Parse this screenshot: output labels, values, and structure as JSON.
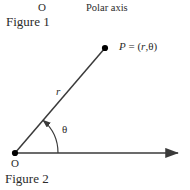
{
  "figure": {
    "caption_top": "Figure 1",
    "caption_bottom": "Figure 2",
    "top_origin_label": "O",
    "polar_axis_label": "Polar axis"
  },
  "diagram": {
    "type": "polar-coordinate-diagram",
    "point_label_p": "P",
    "point_label_equals": " = (",
    "point_label_r": "r",
    "point_label_comma": ",",
    "point_label_theta": "θ",
    "point_label_close": ")",
    "point_label_full": "P = (r,θ)",
    "radius_label": "r",
    "angle_label": "θ",
    "origin_label": "O",
    "line_color": "#3a3a3a",
    "dot_color": "#000000",
    "origin_point": {
      "x": 15,
      "y": 153
    },
    "point_p": {
      "x": 105,
      "y": 48
    },
    "axis_end": {
      "x": 182,
      "y": 153
    },
    "arc_radius": 43,
    "angle_degrees": 49
  }
}
